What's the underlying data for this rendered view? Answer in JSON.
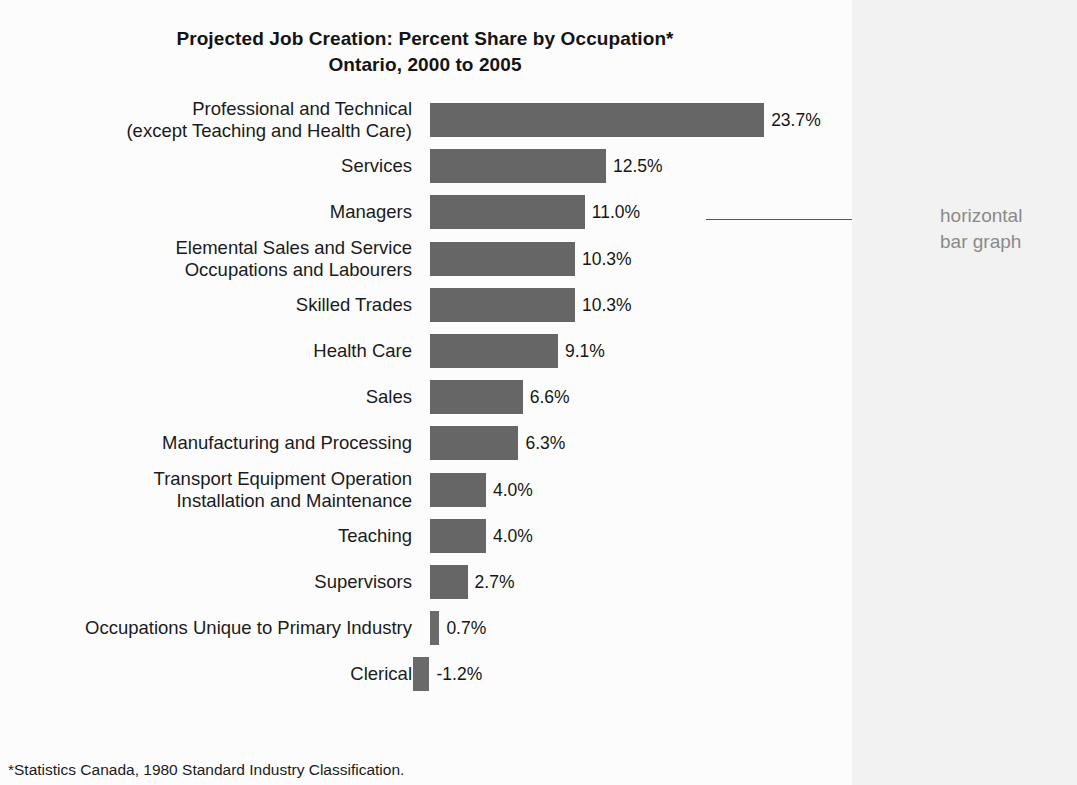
{
  "title": {
    "line1": "Projected Job Creation:  Percent Share by Occupation*",
    "line2": "Ontario, 2000 to 2005"
  },
  "annotation": {
    "text": "horizontal\nbar graph",
    "color": "#8a8a8a"
  },
  "footnote": "*Statistics Canada, 1980 Standard Industry Classification.",
  "colors": {
    "bar": "#666666",
    "axis": "#2b2b2b",
    "text": "#1a1a1a",
    "annotation": "#8a8a8a",
    "page_background": "#fcfcfc",
    "right_strip": "#f2f2f2"
  },
  "chart_data": {
    "type": "bar",
    "orientation": "horizontal",
    "title": "Projected Job Creation:  Percent Share by Occupation*  Ontario, 2000 to 2005",
    "xlabel": "",
    "ylabel": "",
    "xlim": [
      -5,
      25
    ],
    "grid": false,
    "legend": "none",
    "categories": [
      "Professional and Technical\n(except Teaching and Health Care)",
      "Services",
      "Managers",
      "Elemental Sales and Service\nOccupations and Labourers",
      "Skilled Trades",
      "Health Care",
      "Sales",
      "Manufacturing and Processing",
      "Transport Equipment Operation\nInstallation and Maintenance",
      "Teaching",
      "Supervisors",
      "Occupations Unique to Primary Industry",
      "Clerical"
    ],
    "values": [
      23.7,
      12.5,
      11.0,
      10.3,
      10.3,
      9.1,
      6.6,
      6.3,
      4.0,
      4.0,
      2.7,
      0.7,
      -1.2
    ],
    "value_labels": [
      "23.7%",
      "12.5%",
      "11.0%",
      "10.3%",
      "10.3%",
      "9.1%",
      "6.6%",
      "6.3%",
      "4.0%",
      "4.0%",
      "2.7%",
      "0.7%",
      "-1.2%"
    ],
    "xticks": [
      -5,
      5,
      15,
      25
    ],
    "xtick_labels": [
      "-5%",
      "5%",
      "15%",
      "25%"
    ]
  }
}
